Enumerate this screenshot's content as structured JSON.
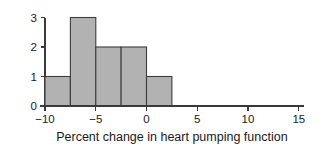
{
  "chart_data": {
    "type": "bar",
    "chart_subtype": "histogram",
    "title": "",
    "subtitle": "",
    "xlabel": "Percent change in heart pumping function",
    "ylabel": "",
    "grid": false,
    "legend": false,
    "legend_position": "none",
    "bin_width": 2.5,
    "bin_edges": [
      -10,
      -7.5,
      -5,
      -2.5,
      0,
      2.5
    ],
    "categories": [
      "-10 to -7.5",
      "-7.5 to -5",
      "-5 to -2.5",
      "-2.5 to 0",
      "0 to 2.5"
    ],
    "bin_centers": [
      -8.75,
      -6.25,
      -3.75,
      -1.25,
      1.25
    ],
    "values": [
      1,
      3,
      2,
      2,
      1
    ],
    "total_count": 9,
    "xlim": [
      -10.5,
      15.5
    ],
    "ylim": [
      0,
      3
    ],
    "xticks": [
      -10,
      -5,
      0,
      5,
      10,
      15
    ],
    "xtick_labels": [
      "−10",
      "−5",
      "0",
      "5",
      "10",
      "15"
    ],
    "yticks": [
      0,
      1,
      2,
      3
    ],
    "ytick_labels": [
      "0",
      "1",
      "2",
      "3"
    ],
    "colors": {
      "bar_fill": "#b2b2b2",
      "bar_stroke": "#3d3d3d",
      "axis": "#3a3a3a",
      "text": "#1a1a1a",
      "background": "#ffffff"
    }
  }
}
